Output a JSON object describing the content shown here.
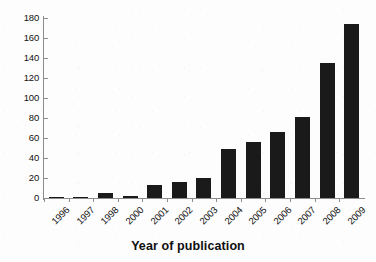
{
  "chart_data": {
    "type": "bar",
    "title": "",
    "xlabel": "Year of publication",
    "ylabel": "",
    "categories": [
      "1996",
      "1997",
      "1998",
      "2000",
      "2001",
      "2002",
      "2003",
      "2004",
      "2005",
      "2006",
      "2007",
      "2008",
      "2009"
    ],
    "values": [
      1,
      1,
      5,
      2,
      13,
      16,
      20,
      49,
      56,
      66,
      81,
      135,
      174
    ],
    "series": [
      {
        "name": "Number of publications",
        "values": [
          1,
          1,
          5,
          2,
          13,
          16,
          20,
          49,
          56,
          66,
          81,
          135,
          174
        ]
      }
    ],
    "ylim": [
      0,
      180
    ],
    "yticks": [
      0,
      20,
      40,
      60,
      80,
      100,
      120,
      140,
      160,
      180
    ],
    "ytick_labels": [
      "0",
      "20",
      "40",
      "60",
      "80",
      "100",
      "120",
      "140",
      "160",
      "180"
    ],
    "xtick_rotation": -45,
    "grid": false,
    "legend": false,
    "legend_position": "none",
    "bar_color": "#1a1a1a",
    "axis_color": "#8c8c8c",
    "background_color": "#fdfdfd"
  },
  "axis": {
    "x_title": "Year of publication"
  }
}
